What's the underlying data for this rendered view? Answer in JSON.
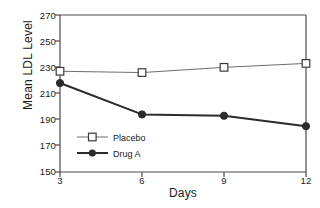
{
  "chart_data": {
    "type": "line",
    "title": "",
    "xlabel": "Days",
    "ylabel": "Mean LDL Level",
    "x": [
      3,
      6,
      9,
      12
    ],
    "xtick_labels": [
      "3",
      "6",
      "9",
      "12"
    ],
    "ytick_labels": [
      "270",
      "250",
      "230",
      "210",
      "190",
      "170",
      "150"
    ],
    "yticks": [
      270,
      250,
      230,
      210,
      190,
      170,
      150
    ],
    "xlim": [
      3,
      12
    ],
    "ylim": [
      150,
      270
    ],
    "grid": false,
    "legend_position": "inside lower-left",
    "series": [
      {
        "name": "Placebo",
        "values": [
          227,
          226,
          230,
          233
        ],
        "marker": "open-square",
        "color": "#6e6e6e",
        "line_width": 1
      },
      {
        "name": "Drug A",
        "values": [
          218,
          194,
          193,
          185
        ],
        "marker": "filled-circle",
        "color": "#2b2b2b",
        "line_width": 2
      }
    ]
  },
  "legend": {
    "entries": [
      {
        "label": "Placebo"
      },
      {
        "label": "Drug A"
      }
    ]
  },
  "colors": {
    "background": "#ffffff",
    "axis": "#4a4a4a",
    "text": "#1a1a1a",
    "placebo": "#6e6e6e",
    "drug_a": "#2b2b2b"
  }
}
